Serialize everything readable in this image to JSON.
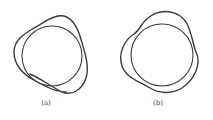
{
  "figure": {
    "panels": [
      {
        "id": "a",
        "label": "(a)",
        "description": "Open knotted loop: circle with wavy strand, free end visible"
      },
      {
        "id": "b",
        "label": "(b)",
        "description": "Closed knotted loop: circle interlaced with three-lobed wavy strand"
      }
    ],
    "stroke_color": "#3a3a3a",
    "background": "#ffffff"
  }
}
